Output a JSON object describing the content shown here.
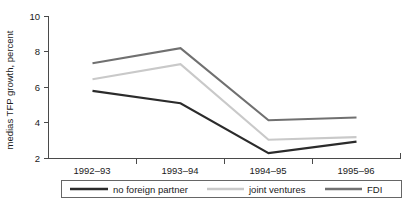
{
  "chart_data": {
    "type": "line",
    "title": "",
    "xlabel": "",
    "ylabel": "medias TFP growth, percent",
    "categories": [
      "1992–93",
      "1993–94",
      "1994–95",
      "1995–96"
    ],
    "ylim": [
      2,
      10
    ],
    "yticks": [
      2,
      4,
      6,
      8,
      10
    ],
    "ytick_labels": [
      "2",
      "4",
      "6",
      "8",
      "10"
    ],
    "grid": false,
    "legend_position": "bottom",
    "series": [
      {
        "name": "no foreign partner",
        "color": "#2b2b2b",
        "values": [
          5.8,
          5.1,
          2.3,
          2.95
        ]
      },
      {
        "name": "joint ventures",
        "color": "#c9c9c9",
        "values": [
          6.45,
          7.3,
          3.05,
          3.2
        ]
      },
      {
        "name": "FDI",
        "color": "#707070",
        "values": [
          7.35,
          8.2,
          4.15,
          4.3
        ]
      }
    ]
  },
  "axis": {
    "y_title": "medias TFP growth, percent",
    "y_tick_0": "2",
    "y_tick_1": "4",
    "y_tick_2": "6",
    "y_tick_3": "8",
    "y_tick_4": "10",
    "x_cat_0": "1992–93",
    "x_cat_1": "1993–94",
    "x_cat_2": "1994–95",
    "x_cat_3": "1995–96"
  },
  "legend": {
    "item_0_label": "no foreign partner",
    "item_1_label": "joint ventures",
    "item_2_label": "FDI"
  },
  "colors": {
    "no_foreign_partner": "#2b2b2b",
    "joint_ventures": "#c9c9c9",
    "fdi": "#707070",
    "axis": "#4a4a4a",
    "background": "#ffffff"
  }
}
